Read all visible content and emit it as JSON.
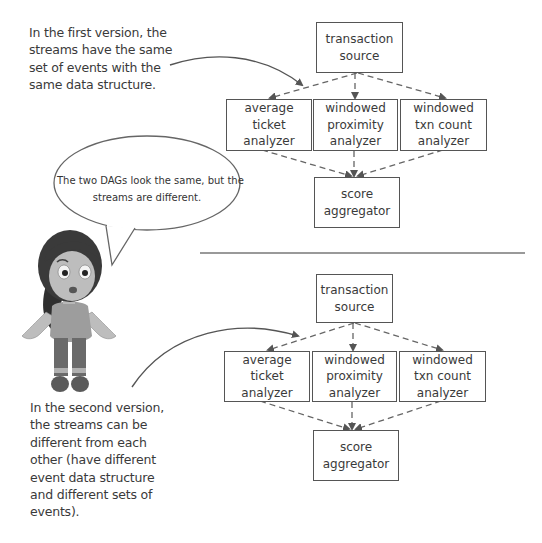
{
  "top_caption": {
    "lines": [
      "In the first version, the",
      "streams have the same",
      "set of events with the",
      "same data structure."
    ]
  },
  "bottom_caption": {
    "lines": [
      "In the second version,",
      "the streams can be",
      "different from each",
      "other (have different",
      "event data structure",
      "and different sets of",
      "events)."
    ]
  },
  "speech_bubble": {
    "lines": [
      "The two DAGs look the same, but the",
      "streams are different."
    ]
  },
  "dag_top": {
    "source": [
      "transaction",
      "source"
    ],
    "analyzers": [
      [
        "average",
        "ticket",
        "analyzer"
      ],
      [
        "windowed",
        "proximity",
        "analyzer"
      ],
      [
        "windowed",
        "txn count",
        "analyzer"
      ]
    ],
    "aggregator": [
      "score",
      "aggregator"
    ]
  },
  "dag_bottom": {
    "source": [
      "transaction",
      "source"
    ],
    "analyzers": [
      [
        "average",
        "ticket",
        "analyzer"
      ],
      [
        "windowed",
        "proximity",
        "analyzer"
      ],
      [
        "windowed",
        "txn count",
        "analyzer"
      ]
    ],
    "aggregator": [
      "score",
      "aggregator"
    ]
  },
  "colors": {
    "line": "#555555",
    "text": "#3a3a3a"
  }
}
